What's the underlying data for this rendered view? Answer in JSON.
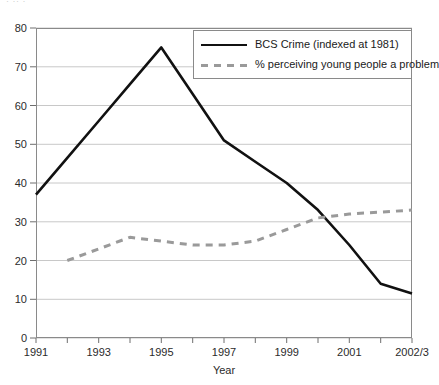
{
  "clipped_header": "· ·· ·",
  "chart_data": {
    "type": "line",
    "title": "",
    "xlabel": "Year",
    "ylabel": "",
    "ylim": [
      0,
      80
    ],
    "yticks": [
      0,
      10,
      20,
      30,
      40,
      50,
      60,
      70,
      80
    ],
    "grid": true,
    "legend_position": "top-right",
    "x": [
      "1991",
      "1992",
      "1993",
      "1994",
      "1995",
      "1996",
      "1997",
      "1998",
      "1999",
      "2000",
      "2001",
      "2002",
      "2002/3"
    ],
    "xtick_labels": [
      "1991",
      "1993",
      "1995",
      "1997",
      "1999",
      "2001",
      "2002/3"
    ],
    "xtick_label_positions": [
      "1991",
      "1993",
      "1995",
      "1997",
      "1999",
      "2001",
      "2002/3"
    ],
    "series": [
      {
        "name": "BCS Crime (indexed at 1981)",
        "style": "solid",
        "color": "#111111",
        "values": [
          37,
          46.5,
          56,
          65.5,
          75,
          63,
          51,
          45.5,
          40,
          33,
          24,
          14,
          11.5
        ]
      },
      {
        "name": "% perceiving young people a problem",
        "style": "dashed",
        "color": "#9a9a9a",
        "values": [
          null,
          20,
          23,
          26,
          25,
          24,
          24,
          25,
          28,
          31,
          32,
          32.5,
          33
        ]
      }
    ]
  },
  "legend": {
    "items": [
      {
        "label": "BCS Crime (indexed at 1981)",
        "style": "solid"
      },
      {
        "label": "% perceiving young people a problem",
        "style": "dashed"
      }
    ]
  },
  "axes": {
    "x_title": "Year",
    "y_tick_labels": [
      "80",
      "70",
      "60",
      "50",
      "40",
      "30",
      "20",
      "10",
      "0"
    ],
    "x_tick_labels": [
      "1991",
      "1993",
      "1995",
      "1997",
      "1999",
      "2001",
      "2002/3"
    ]
  },
  "colors": {
    "series_solid": "#111111",
    "series_dashed": "#9a9a9a",
    "grid": "#c8c8c8",
    "frame": "#8a8a8a",
    "text": "#1a1a1a"
  }
}
